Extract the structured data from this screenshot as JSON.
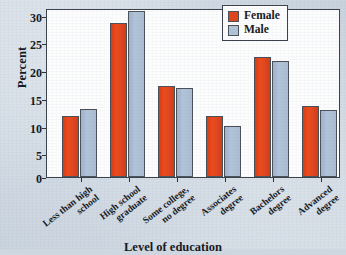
{
  "chart_data": {
    "type": "bar",
    "title": "",
    "xlabel": "Level of education",
    "ylabel": "Percent",
    "ylim": [
      0,
      30
    ],
    "yticks": [
      0,
      5,
      10,
      15,
      20,
      25,
      30
    ],
    "grid": false,
    "legend_position": "top-right",
    "categories": [
      "Less than high school",
      "High school graduate",
      "Some college, no degree",
      "Associates degree",
      "Bachelors degree",
      "Advanced degree"
    ],
    "category_lines": [
      [
        "Less than high",
        "school"
      ],
      [
        "High school",
        "graduate"
      ],
      [
        "Some college,",
        "no degree"
      ],
      [
        "Associates",
        "degree"
      ],
      [
        "Bachelors",
        "degree"
      ],
      [
        "Advanced",
        "degree"
      ]
    ],
    "series": [
      {
        "name": "Female",
        "color": "#e2441a",
        "values": [
          11.0,
          27.7,
          16.4,
          11.0,
          21.6,
          12.7
        ]
      },
      {
        "name": "Male",
        "color": "#b2c4d8",
        "values": [
          12.3,
          29.9,
          16.0,
          9.2,
          20.8,
          12.1
        ]
      }
    ]
  },
  "legend": {
    "items": [
      {
        "label": "Female",
        "color": "#e2441a"
      },
      {
        "label": "Male",
        "color": "#b2c4d8"
      }
    ]
  },
  "axes": {
    "y_title": "Percent",
    "x_title": "Level of education",
    "y_tick_labels": [
      "30",
      "25",
      "20",
      "15",
      "10",
      "5",
      "0"
    ]
  }
}
